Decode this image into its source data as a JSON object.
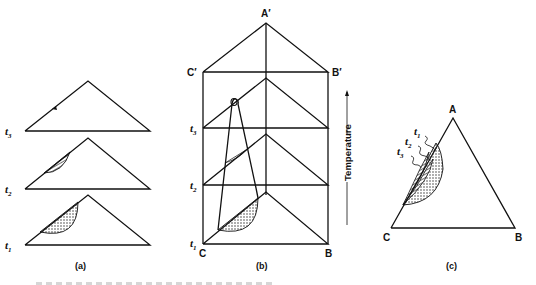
{
  "figure": {
    "panels": [
      {
        "id": "a",
        "caption": "(a)",
        "levels": [
          {
            "label": "t",
            "sub": "3"
          },
          {
            "label": "t",
            "sub": "2"
          },
          {
            "label": "t",
            "sub": "1"
          }
        ]
      },
      {
        "id": "b",
        "caption": "(b)",
        "vertices": {
          "top_apex": "A′",
          "top_left": "C′",
          "top_right": "B′",
          "bottom_left": "C",
          "bottom_right": "B"
        },
        "levels": [
          {
            "label": "t",
            "sub": "3"
          },
          {
            "label": "t",
            "sub": "2"
          },
          {
            "label": "t",
            "sub": "1"
          }
        ],
        "axis_label": "Temperature"
      },
      {
        "id": "c",
        "caption": "(c)",
        "vertices": {
          "apex": "A",
          "bottom_left": "C",
          "bottom_right": "B"
        },
        "curve_labels": [
          {
            "label": "t",
            "sub": "1"
          },
          {
            "label": "t",
            "sub": "2"
          },
          {
            "label": "t",
            "sub": "3"
          }
        ]
      }
    ]
  }
}
